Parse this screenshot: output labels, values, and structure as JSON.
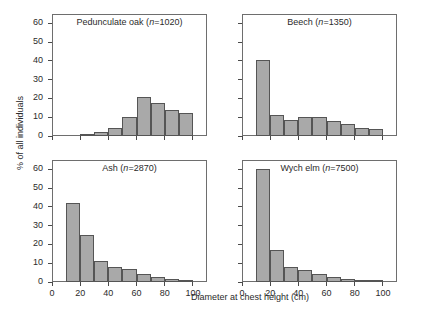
{
  "figure": {
    "xlabel": "Diameter at chest height (cm)",
    "ylabel": "% of all individuals",
    "bar_color": "#a9a9a9",
    "bar_edge_color": "#555555",
    "axis_color": "#6e6e6e"
  },
  "chart_data": {
    "type": "bar",
    "title": "",
    "xlabel": "Diameter at chest height (cm)",
    "ylabel": "% of all individuals",
    "xlim": [
      0,
      110
    ],
    "ylim": [
      0,
      65
    ],
    "xticks": [
      0,
      20,
      40,
      60,
      80,
      100
    ],
    "yticks": [
      0,
      10,
      20,
      30,
      40,
      50,
      60
    ],
    "xticklabels": [
      "0",
      "20",
      "40",
      "60",
      "80",
      "100"
    ],
    "yticklabels": [
      "0",
      "10",
      "20",
      "30",
      "40",
      "50",
      "60"
    ],
    "grid": false,
    "legend": "none",
    "bin_edges": [
      10,
      20,
      30,
      40,
      50,
      60,
      70,
      80,
      90,
      100
    ],
    "bin_width": 10,
    "panels": [
      {
        "id": "pedunculate-oak",
        "title": "Pedunculate oak (n=1020)",
        "species": "Pedunculate oak",
        "n": 1020,
        "n_label": "n=1020",
        "bin_starts": [
          10,
          20,
          30,
          40,
          50,
          60,
          70,
          80,
          90
        ],
        "values": [
          0,
          1.2,
          2.2,
          4.2,
          10.0,
          21.0,
          17.5,
          14.0,
          12.2
        ]
      },
      {
        "id": "beech",
        "title": "Beech (n=1350)",
        "species": "Beech",
        "n": 1350,
        "n_label": "n=1350",
        "bin_starts": [
          10,
          20,
          30,
          40,
          50,
          60,
          70,
          80,
          90
        ],
        "values": [
          40.5,
          11.0,
          8.5,
          10.0,
          10.0,
          8.0,
          6.5,
          4.5,
          3.5
        ]
      },
      {
        "id": "ash",
        "title": "Ash (n=2870)",
        "species": "Ash",
        "n": 2870,
        "n_label": "n=2870",
        "bin_starts": [
          10,
          20,
          30,
          40,
          50,
          60,
          70,
          80,
          90
        ],
        "values": [
          42.0,
          25.0,
          11.0,
          8.0,
          7.0,
          4.5,
          2.5,
          1.5,
          1.0
        ]
      },
      {
        "id": "wych-elm",
        "title": "Wych elm (n=7500)",
        "species": "Wych elm",
        "n": 7500,
        "n_label": "n=7500",
        "bin_starts": [
          10,
          20,
          30,
          40,
          50,
          60,
          70,
          80,
          90
        ],
        "values": [
          60.0,
          17.0,
          8.0,
          6.5,
          4.5,
          2.5,
          1.5,
          1.0,
          1.0
        ]
      }
    ]
  }
}
